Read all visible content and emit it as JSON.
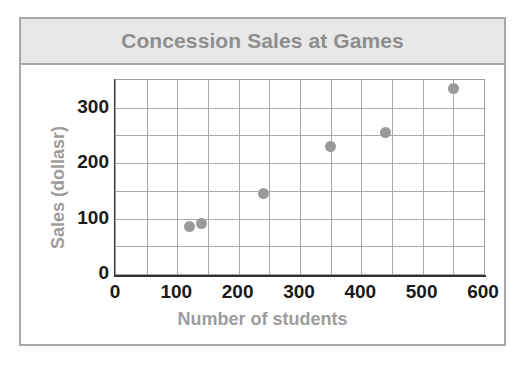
{
  "chart_data": {
    "type": "scatter",
    "title": "Concession Sales at Games",
    "xlabel": "Number of students",
    "ylabel": "Sales (dollasr)",
    "xlim": [
      0,
      600
    ],
    "ylim": [
      0,
      350
    ],
    "xticks": [
      0,
      100,
      200,
      300,
      400,
      500,
      600
    ],
    "yticks": [
      0,
      100,
      200,
      300
    ],
    "x_minor_step": 50,
    "y_minor_step": 50,
    "grid": true,
    "legend": null,
    "marker_color": "#9a9a9a",
    "points": [
      {
        "x": 120,
        "y": 85
      },
      {
        "x": 140,
        "y": 92
      },
      {
        "x": 240,
        "y": 145
      },
      {
        "x": 350,
        "y": 230
      },
      {
        "x": 440,
        "y": 255
      },
      {
        "x": 550,
        "y": 335
      }
    ],
    "x": [
      120,
      140,
      240,
      350,
      440,
      550
    ],
    "values": [
      85,
      92,
      145,
      230,
      255,
      335
    ]
  },
  "figure": {
    "title": "Concession Sales at Games",
    "title_band_color": "#e8e8e8",
    "border_color": "#a8a8a8",
    "label_color": "#9c9c9c",
    "tick_color": "#1a1a1a",
    "grid_color": "#a9a9a9"
  }
}
